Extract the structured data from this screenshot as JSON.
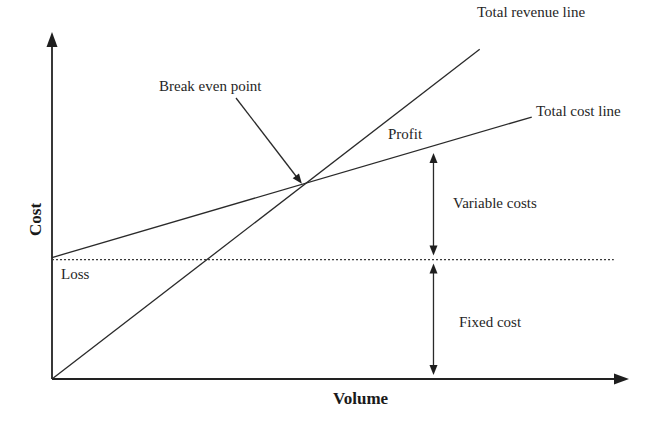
{
  "chart_data": {
    "type": "line",
    "title": "",
    "xlabel": "Volume",
    "ylabel": "Cost",
    "grid": false,
    "legend": "none",
    "xlim": [
      0,
      10
    ],
    "ylim": [
      0,
      10
    ],
    "series": [
      {
        "name": "Total revenue line",
        "label": "Total revenue line",
        "style": "solid",
        "x": [
          0,
          7.4
        ],
        "y": [
          0,
          9.5
        ]
      },
      {
        "name": "Total cost line",
        "label": "Total cost line",
        "style": "solid",
        "x": [
          0,
          8.3
        ],
        "y": [
          3.5,
          7.55
        ]
      },
      {
        "name": "Fixed cost level",
        "label": "",
        "style": "dotted",
        "x": [
          0,
          9.72
        ],
        "y": [
          3.44,
          3.44
        ]
      }
    ],
    "annotations": {
      "break_even": {
        "text": "Break even point",
        "x": 4.34,
        "y": 5.59
      },
      "profit": {
        "text": "Profit"
      },
      "loss": {
        "text": "Loss"
      },
      "variable_costs": {
        "text": "Variable costs",
        "x": 6.6,
        "y_from": 3.44,
        "y_to": 6.6
      },
      "fixed_cost": {
        "text": "Fixed cost",
        "x": 6.6,
        "y_from": 0,
        "y_to": 3.44
      }
    }
  },
  "labels": {
    "y_axis": "Cost",
    "x_axis": "Volume",
    "total_revenue": "Total revenue line",
    "total_cost": "Total cost line",
    "break_even": "Break even point",
    "profit": "Profit",
    "loss": "Loss",
    "variable_costs": "Variable costs",
    "fixed_cost": "Fixed cost"
  },
  "colors": {
    "ink": "#262626",
    "background": "#ffffff"
  }
}
